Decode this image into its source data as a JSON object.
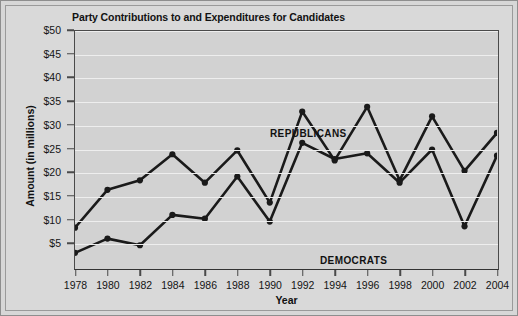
{
  "chart_data": {
    "type": "line",
    "title": "Party Contributions to and Expenditures for Candidates",
    "xlabel": "Year",
    "ylabel": "Amount (in millions)",
    "x": [
      1978,
      1980,
      1982,
      1984,
      1986,
      1988,
      1990,
      1992,
      1994,
      1996,
      1998,
      2000,
      2002,
      2004
    ],
    "categories": [
      "1978",
      "1980",
      "1982",
      "1984",
      "1986",
      "1988",
      "1990",
      "1992",
      "1994",
      "1996",
      "1998",
      "2000",
      "2002",
      "2004"
    ],
    "xlim": [
      1978,
      2004
    ],
    "ylim": [
      0,
      50
    ],
    "yticks": [
      5,
      10,
      15,
      20,
      25,
      30,
      35,
      40,
      45,
      50
    ],
    "ytick_labels": [
      "$5",
      "$10",
      "$15",
      "$20",
      "$25",
      "$30",
      "$35",
      "$40",
      "$45",
      "$50"
    ],
    "grid": true,
    "legend": "inline-annotations",
    "series": [
      {
        "name": "REPUBLICANS",
        "color": "#1a1a1a",
        "values": [
          8.5,
          16.5,
          18.5,
          24.0,
          18.0,
          24.8,
          13.8,
          33.0,
          22.7,
          34.0,
          18.5,
          32.0,
          20.5,
          28.5
        ]
      },
      {
        "name": "DEMOCRATS",
        "color": "#1a1a1a",
        "values": [
          3.2,
          6.2,
          4.8,
          11.2,
          10.4,
          19.3,
          9.8,
          26.4,
          23.0,
          24.2,
          18.0,
          25.0,
          8.8,
          23.7
        ]
      }
    ],
    "annotations": [
      {
        "text": "REPUBLICANS",
        "x": 1990,
        "y": 31
      },
      {
        "text": "DEMOCRATS",
        "x": 1993,
        "y": 13
      }
    ],
    "colors": {
      "figure_background": "#d9d9d9",
      "plot_background": "#d2d2d2",
      "gridline": "#eeeeee",
      "axis": "#4a4a4a",
      "line": "#1a1a1a",
      "text": "#121212",
      "border": "#8e8e8e"
    }
  }
}
